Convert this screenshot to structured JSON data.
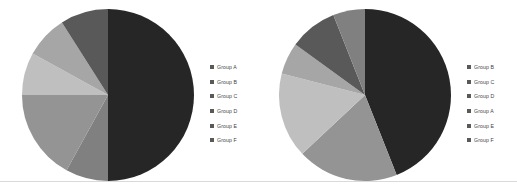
{
  "page": {
    "background_color": "#ffffff",
    "divider_color": "#d9d9d9"
  },
  "palette": {
    "dark": "#262626",
    "mid_dark": "#595959",
    "mid": "#808080",
    "mid_light": "#949494",
    "light": "#bfbfbf",
    "lighter": "#a6a6a6",
    "legend_marker": "#595959"
  },
  "charts": [
    {
      "id": "pie-chart-left",
      "legend": {
        "position": "right",
        "items": [
          {
            "label": "Group A",
            "color": "#595959"
          },
          {
            "label": "Group B",
            "color": "#595959"
          },
          {
            "label": "Group C",
            "color": "#595959"
          },
          {
            "label": "Group D",
            "color": "#595959"
          },
          {
            "label": "Group E",
            "color": "#595959"
          },
          {
            "label": "Group F",
            "color": "#595959"
          }
        ]
      }
    },
    {
      "id": "pie-chart-right",
      "legend": {
        "position": "right",
        "items": [
          {
            "label": "Group B",
            "color": "#595959"
          },
          {
            "label": "Group C",
            "color": "#595959"
          },
          {
            "label": "Group D",
            "color": "#595959"
          },
          {
            "label": "Group A",
            "color": "#595959"
          },
          {
            "label": "Group E",
            "color": "#595959"
          },
          {
            "label": "Group F",
            "color": "#595959"
          }
        ]
      }
    }
  ],
  "chart_data": [
    {
      "type": "pie",
      "title": "",
      "categories": [
        "Group A",
        "Group B",
        "Group C",
        "Group D",
        "Group E",
        "Group F"
      ],
      "values": [
        50,
        8,
        17,
        8,
        8,
        9
      ],
      "unit": "percent",
      "start_angle_deg": 0,
      "direction": "clockwise",
      "colors": [
        "#262626",
        "#808080",
        "#949494",
        "#bfbfbf",
        "#a6a6a6",
        "#595959"
      ],
      "legend": [
        "Group A",
        "Group B",
        "Group C",
        "Group D",
        "Group E",
        "Group F"
      ],
      "legend_position": "right",
      "grid": false
    },
    {
      "type": "pie",
      "title": "",
      "categories": [
        "Group B",
        "Group C",
        "Group D",
        "Group A",
        "Group E",
        "Group F"
      ],
      "values": [
        44,
        19,
        16,
        6,
        9,
        6
      ],
      "unit": "percent",
      "start_angle_deg": 0,
      "direction": "clockwise",
      "colors": [
        "#262626",
        "#949494",
        "#bfbfbf",
        "#a6a6a6",
        "#595959",
        "#808080"
      ],
      "legend": [
        "Group B",
        "Group C",
        "Group D",
        "Group A",
        "Group E",
        "Group F"
      ],
      "legend_position": "right",
      "grid": false
    }
  ]
}
